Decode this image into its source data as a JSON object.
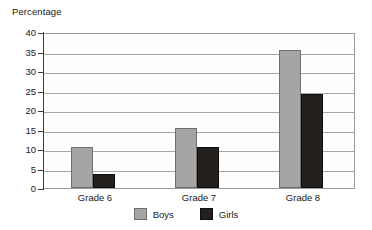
{
  "chart_data": {
    "type": "bar",
    "title": "Percentage",
    "xlabel": "",
    "ylabel": "Percentage",
    "categories": [
      "Grade 6",
      "Grade 7",
      "Grade 8"
    ],
    "series": [
      {
        "name": "Boys",
        "color": "#a5a5a5",
        "values": [
          10.5,
          15.5,
          35.5
        ]
      },
      {
        "name": "Girls",
        "color": "#231f1c",
        "values": [
          3.5,
          10.5,
          24
        ]
      }
    ],
    "ylim": [
      0,
      40
    ],
    "ytick_step": 5,
    "yticks": [
      "0",
      "5",
      "10",
      "15",
      "20",
      "25",
      "30",
      "35",
      "40"
    ],
    "grid": true,
    "legend_position": "bottom"
  },
  "legend": {
    "items": [
      {
        "label": "Boys"
      },
      {
        "label": "Girls"
      }
    ]
  }
}
